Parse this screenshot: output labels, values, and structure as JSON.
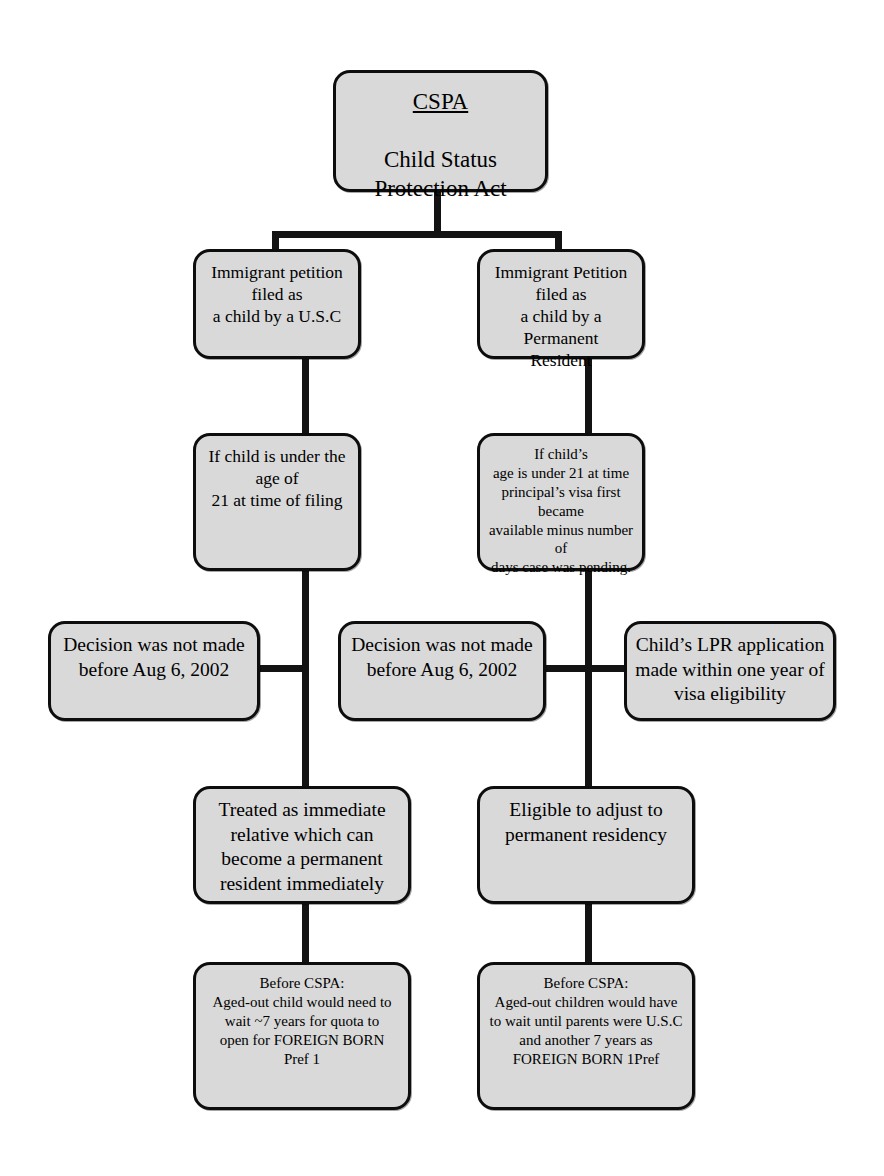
{
  "diagram": {
    "background_color": "#ffffff",
    "box_fill_color": "#d9d9d9",
    "box_border_color": "#0d0d0d",
    "connector_color": "#131313"
  },
  "nodes": {
    "root": {
      "heading": "CSPA",
      "body": "Child Status\nProtection Act"
    },
    "usc_petition": {
      "text": "Immigrant petition filed as\na child by a U.S.C"
    },
    "lpr_petition": {
      "text": "Immigrant Petition filed as\na child by a Permanent\nResident"
    },
    "usc_age_test": {
      "text": "If child is under the age of\n21 at time of filing"
    },
    "lpr_age_test": {
      "text": "If child’s\nage is under 21 at time\nprincipal’s visa first became\navailable minus number of\ndays case was pending."
    },
    "usc_decision_date": {
      "text": "Decision was not made\nbefore Aug 6, 2002"
    },
    "lpr_decision_date": {
      "text": "Decision was not made\nbefore Aug 6, 2002"
    },
    "lpr_application_window": {
      "text": "Child’s LPR application\nmade within one year of\nvisa eligibility"
    },
    "usc_outcome": {
      "text": "Treated as immediate\nrelative which can\nbecome a permanent\nresident immediately"
    },
    "lpr_outcome": {
      "text": "Eligible to adjust to\npermanent residency"
    },
    "usc_before_cspa": {
      "text": "Before CSPA:\nAged-out child would need to\nwait ~7 years for quota to\nopen for FOREIGN BORN\nPref 1"
    },
    "lpr_before_cspa": {
      "text": "Before CSPA:\nAged-out children would have\nto wait until parents were U.S.C\nand another 7 years as\nFOREIGN BORN 1Pref"
    }
  }
}
